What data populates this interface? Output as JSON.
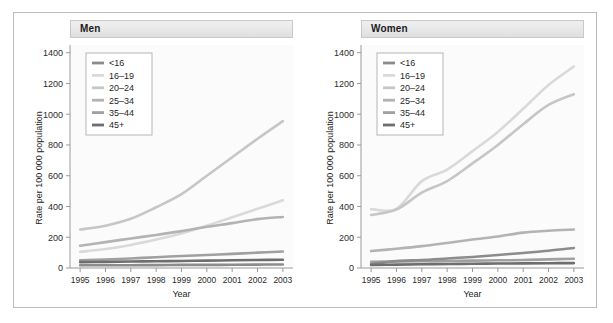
{
  "figure": {
    "background": "#ffffff",
    "border_color": "#bdbdbd",
    "panel_strip_color": "#e6e6e6"
  },
  "panels": [
    {
      "key": "men",
      "title": "Men"
    },
    {
      "key": "women",
      "title": "Women"
    }
  ],
  "axis": {
    "xlabel": "Year",
    "ylabel": "Rate per 100 000 population",
    "ylabel_plain": "Rate per 100000 population",
    "yticks": [
      "0",
      "200",
      "400",
      "600",
      "800",
      "1000",
      "1200",
      "1400"
    ],
    "xticks": [
      "1995",
      "1996",
      "1997",
      "1998",
      "1999",
      "2000",
      "2001",
      "2002",
      "2003"
    ]
  },
  "legend": {
    "entries": [
      {
        "label": "<16",
        "color": "#8c8c8c"
      },
      {
        "label": "16–19",
        "color": "#d9d9d9"
      },
      {
        "label": "20–24",
        "color": "#c6c6c6"
      },
      {
        "label": "25–34",
        "color": "#b3b3b3"
      },
      {
        "label": "35–44",
        "color": "#a0a0a0"
      },
      {
        "label": "45+",
        "color": "#6e6e6e"
      }
    ]
  },
  "chart_data": {
    "type": "line",
    "title": "",
    "xlabel": "Year",
    "ylabel": "Rate per 100 000 population",
    "x": [
      1995,
      1996,
      1997,
      1998,
      1999,
      2000,
      2001,
      2002,
      2003
    ],
    "xlim": [
      1994.6,
      2003.4
    ],
    "ylim": [
      0,
      1450
    ],
    "yticks": [
      0,
      200,
      400,
      600,
      800,
      1000,
      1200,
      1400
    ],
    "grid": false,
    "legend_position": "upper-left (inside axes)",
    "panels": [
      {
        "name": "Men",
        "series": [
          {
            "name": "<16",
            "color": "#8c8c8c",
            "values": [
              18,
              18,
              18,
              19,
              20,
              20,
              21,
              22,
              23
            ]
          },
          {
            "name": "16–19",
            "color": "#d9d9d9",
            "values": [
              105,
              123,
              150,
              185,
              225,
              275,
              330,
              385,
              440
            ]
          },
          {
            "name": "20–24",
            "color": "#c6c6c6",
            "values": [
              250,
              275,
              320,
              395,
              480,
              600,
              720,
              840,
              955
            ]
          },
          {
            "name": "25–34",
            "color": "#b3b3b3",
            "values": [
              145,
              168,
              192,
              215,
              240,
              268,
              292,
              318,
              332
            ]
          },
          {
            "name": "35–44",
            "color": "#a0a0a0",
            "values": [
              50,
              55,
              62,
              70,
              78,
              85,
              92,
              100,
              107
            ]
          },
          {
            "name": "45+",
            "color": "#6e6e6e",
            "values": [
              38,
              40,
              42,
              44,
              46,
              48,
              50,
              52,
              54
            ]
          }
        ]
      },
      {
        "name": "Women",
        "series": [
          {
            "name": "<16",
            "color": "#8c8c8c",
            "values": [
              25,
              45,
              52,
              62,
              72,
              85,
              98,
              112,
              130
            ]
          },
          {
            "name": "16–19",
            "color": "#d9d9d9",
            "values": [
              383,
              385,
              565,
              640,
              760,
              885,
              1035,
              1190,
              1310
            ]
          },
          {
            "name": "20–24",
            "color": "#c6c6c6",
            "values": [
              345,
              380,
              490,
              565,
              680,
              800,
              935,
              1060,
              1130
            ]
          },
          {
            "name": "25–34",
            "color": "#b3b3b3",
            "values": [
              110,
              125,
              142,
              163,
              185,
              205,
              230,
              242,
              250
            ]
          },
          {
            "name": "35–44",
            "color": "#a0a0a0",
            "values": [
              40,
              42,
              44,
              46,
              48,
              50,
              52,
              56,
              60
            ]
          },
          {
            "name": "45+",
            "color": "#6e6e6e",
            "values": [
              20,
              22,
              24,
              26,
              28,
              29,
              30,
              31,
              32
            ]
          }
        ]
      }
    ]
  }
}
